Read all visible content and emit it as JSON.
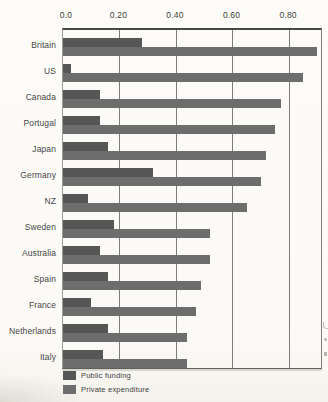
{
  "chart_data": {
    "type": "bar",
    "orientation": "horizontal",
    "title": "",
    "xlabel": "",
    "ylabel": "",
    "categories": [
      "Britain",
      "US",
      "Canada",
      "Portugal",
      "Japan",
      "Germany",
      "NZ",
      "Sweden",
      "Australia",
      "Spain",
      "France",
      "Netherlands",
      "Italy"
    ],
    "series": [
      {
        "name": "Public funding",
        "color": "#565656",
        "values": [
          0.28,
          0.03,
          0.13,
          0.13,
          0.16,
          0.32,
          0.09,
          0.18,
          0.13,
          0.16,
          0.1,
          0.16,
          0.14
        ]
      },
      {
        "name": "Private expenditure",
        "color": "#6d6d6d",
        "values": [
          0.9,
          0.85,
          0.77,
          0.75,
          0.72,
          0.7,
          0.65,
          0.52,
          0.52,
          0.49,
          0.47,
          0.44,
          0.44
        ]
      }
    ],
    "xlim": [
      0,
      0.913
    ],
    "x_ticks": [
      0,
      0.2,
      0.4,
      0.6,
      0.8
    ],
    "x_tick_labels": [
      "0.0",
      "0.20",
      "0.40",
      "0.60",
      "0.80"
    ],
    "grid": true,
    "gridline_color": "#7c7c79",
    "legend_position": "bottom-left"
  },
  "legend": {
    "items": [
      {
        "label": "Public funding",
        "color": "#565656"
      },
      {
        "label": "Private expenditure",
        "color": "#6d6d6d"
      }
    ]
  }
}
